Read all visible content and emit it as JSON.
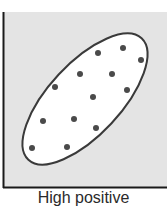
{
  "chart_data": {
    "type": "scatter",
    "title": "",
    "caption": "High positive",
    "xlabel": "",
    "ylabel": "",
    "grid": false,
    "legend": null,
    "annotation": "ellipse enclosing points, tilted upward to the right",
    "points_pixel": [
      {
        "x": 98,
        "y": 53
      },
      {
        "x": 123,
        "y": 48
      },
      {
        "x": 141,
        "y": 60
      },
      {
        "x": 80,
        "y": 74
      },
      {
        "x": 112,
        "y": 74
      },
      {
        "x": 55,
        "y": 87
      },
      {
        "x": 127,
        "y": 90
      },
      {
        "x": 93,
        "y": 97
      },
      {
        "x": 43,
        "y": 121
      },
      {
        "x": 74,
        "y": 119
      },
      {
        "x": 96,
        "y": 128
      },
      {
        "x": 32,
        "y": 148
      },
      {
        "x": 67,
        "y": 147
      }
    ],
    "colors": {
      "background": "#e4e4e4",
      "ellipse_fill": "#ffffff",
      "ellipse_stroke": "#3a3a3a",
      "point": "#4a4a4a",
      "axis": "#1a1a1a"
    }
  }
}
